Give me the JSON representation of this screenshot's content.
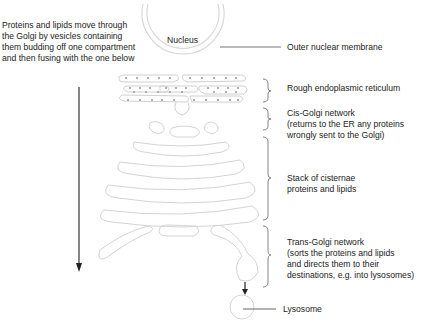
{
  "description": {
    "lines": [
      "Proteins and lipids move through",
      "the Golgi by vesicles containing",
      "them budding off one compartment",
      "and then fusing with the one below"
    ]
  },
  "nucleus": {
    "label": "Nucleus"
  },
  "labels": {
    "outer_membrane": "Outer nuclear membrane",
    "rough_er": "Rough endoplasmic reticulum",
    "cis_golgi": {
      "title": "Cis-Golgi network",
      "lines": [
        "(returns to the ER any proteins",
        "wrongly sent to the Golgi)"
      ]
    },
    "stack": {
      "title": "Stack of cisternae",
      "lines": [
        "proteins and lipids"
      ]
    },
    "trans_golgi": {
      "title": "Trans-Golgi network",
      "lines": [
        "(sorts the proteins and lipids",
        "and directs them to their",
        "destinations, e.g. into lysosomes)"
      ]
    },
    "lysosome": "Lysosome"
  },
  "colors": {
    "outline": "#cfcfcf",
    "leader": "#555555",
    "arrow": "#222222",
    "text": "#222222"
  }
}
